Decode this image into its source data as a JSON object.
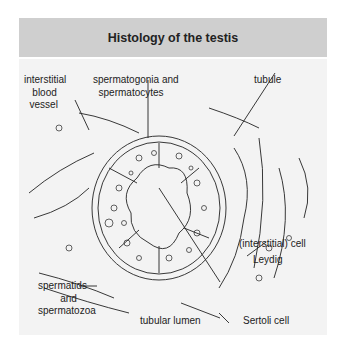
{
  "title": "Histology of the testis",
  "labels": {
    "vessel": "interstitial\n   blood\n  vessel",
    "spermatogonia": "spermatogonia and\n  spermatocytes",
    "tubule": "tubule",
    "leydig1": "(interstitial) cell",
    "leydig2": "Leydig",
    "spermatids": "spermatids\n        and\nspermatozoa",
    "lumen": "tubular lumen",
    "sertoli": "Sertoli cell"
  },
  "colors": {
    "header": "#cfcfcf",
    "panel": "#f3f3f3",
    "ink": "#222222"
  }
}
